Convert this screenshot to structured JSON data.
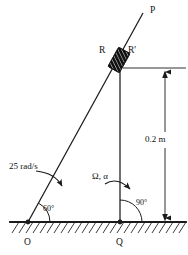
{
  "figure": {
    "type": "mechanism-kinematics-diagram",
    "background_color": "#ffffff",
    "line_color": "#1a1a1a",
    "labels": {
      "point_o": "O",
      "point_q": "Q",
      "point_p": "P",
      "collar_r": "R",
      "collar_r_prime": "R'",
      "angular_velocity": "25 rad/s",
      "omega_alpha": "Ω, α",
      "angle_at_o": "60°",
      "angle_at_q": "90°",
      "dimension_height": "0.2 m"
    }
  },
  "geometry": {
    "ground_line": {
      "x1": 10,
      "y1": 222,
      "x2": 186,
      "y2": 222
    },
    "hatch": {
      "start_x": 12,
      "end_x": 186,
      "length": 11,
      "spacing": 7,
      "angle_dx": -7,
      "angle_dy": 11
    },
    "rod_op": {
      "x1": 28,
      "y1": 222,
      "x2": 143,
      "y2": 13
    },
    "rod_qr": {
      "x1": 120,
      "y1": 222,
      "x2": 120,
      "y2": 68
    },
    "pivot_o": {
      "cx": 28,
      "cy": 222,
      "r": 2.2
    },
    "pivot_q": {
      "cx": 120,
      "cy": 222,
      "r": 2.2
    },
    "collar": {
      "cx": 119,
      "cy": 60,
      "w": 12,
      "h": 22,
      "rotation": -61
    },
    "extension_line": {
      "x1": 123,
      "y1": 68,
      "x2": 186,
      "y2": 68
    },
    "dimension_line": {
      "x": 165,
      "y_top": 68,
      "y_bottom": 222
    },
    "angle_arc_o": {
      "cx": 28,
      "cy": 222,
      "r": 22,
      "start_deg": 0,
      "end_deg": 61
    },
    "angle_arc_q": {
      "cx": 120,
      "cy": 222,
      "r": 22,
      "start_deg": 0,
      "end_deg": 90
    },
    "curved_arrow_left": {
      "path": "M 36 172 Q 54 174 63 188"
    },
    "curved_arrow_right": {
      "path": "M 106 182 Q 118 178 131 190"
    }
  },
  "label_positions": {
    "point_o": {
      "x": 24,
      "y": 243
    },
    "point_q": {
      "x": 116,
      "y": 243
    },
    "point_p": {
      "x": 150,
      "y": 11
    },
    "collar_r": {
      "x": 99,
      "y": 51
    },
    "collar_r_prime": {
      "x": 128,
      "y": 51
    },
    "angular_velocity": {
      "x": 10,
      "y": 167
    },
    "omega_alpha": {
      "x": 92,
      "y": 177
    },
    "angle_at_o": {
      "x": 44,
      "y": 208
    },
    "angle_at_q": {
      "x": 137,
      "y": 203
    },
    "dimension_height": {
      "x": 145,
      "y": 140
    }
  }
}
